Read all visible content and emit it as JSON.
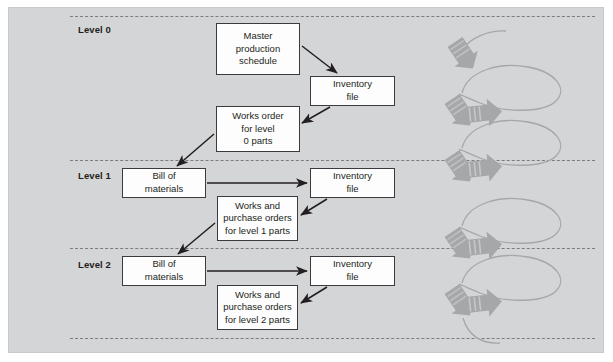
{
  "figure": {
    "kind": "mrp-level-flow-diagram",
    "panel": {
      "background_color": "#d4d5d6",
      "border_color": "#c8c9ca"
    },
    "box_style": {
      "fill": "#fdfdfd",
      "stroke": "#3b3b3d"
    },
    "arrow_color": "#231f20",
    "spiral_color": "#a6a7a9",
    "separator_color": "#7b7c7e"
  },
  "levels": [
    {
      "id": "level-0",
      "label": "Level 0"
    },
    {
      "id": "level-1",
      "label": "Level 1"
    },
    {
      "id": "level-2",
      "label": "Level 2"
    }
  ],
  "boxes": [
    {
      "id": "master-production-schedule",
      "lines": [
        "Master",
        "production",
        "schedule"
      ]
    },
    {
      "id": "inventory-file-level-0",
      "lines": [
        "Inventory",
        "file"
      ]
    },
    {
      "id": "works-order-level-0",
      "lines": [
        "Works order",
        "for level",
        "0 parts"
      ]
    },
    {
      "id": "bill-of-materials-level-1",
      "lines": [
        "Bill of",
        "materials"
      ]
    },
    {
      "id": "inventory-file-level-1",
      "lines": [
        "Inventory",
        "file"
      ]
    },
    {
      "id": "works-purchase-orders-level-1",
      "lines": [
        "Works and",
        "purchase orders",
        "for level 1 parts"
      ]
    },
    {
      "id": "bill-of-materials-level-2",
      "lines": [
        "Bill of",
        "materials"
      ]
    },
    {
      "id": "inventory-file-level-2",
      "lines": [
        "Inventory",
        "file"
      ]
    },
    {
      "id": "works-purchase-orders-level-2",
      "lines": [
        "Works and",
        "purchase orders",
        "for level 2 parts"
      ]
    }
  ],
  "spiral": {
    "name": "time-phasing-spiral",
    "loop_count": 4,
    "left_arrow_count": 5,
    "right_arrow_count": 4
  }
}
